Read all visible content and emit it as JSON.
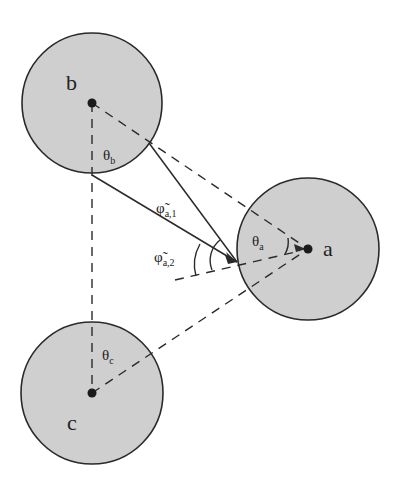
{
  "diagram": {
    "nodes": [
      {
        "id": "a",
        "label": "a",
        "cx": 308,
        "cy": 249,
        "r": 71
      },
      {
        "id": "b",
        "label": "b",
        "cx": 92,
        "cy": 103,
        "r": 71
      },
      {
        "id": "c",
        "label": "c",
        "cx": 92,
        "cy": 393,
        "r": 71
      }
    ],
    "angles": {
      "theta_a": {
        "symbol": "θ",
        "sub": "a"
      },
      "theta_b": {
        "symbol": "θ",
        "sub": "b"
      },
      "theta_c": {
        "symbol": "θ",
        "sub": "c"
      },
      "phi_a1": {
        "symbol": "φ̃",
        "sub": "a,1"
      },
      "phi_a2": {
        "symbol": "φ̃",
        "sub": "a,2"
      }
    },
    "colors": {
      "node_fill": "#cfcfcf",
      "stroke": "#2a2a2a"
    }
  }
}
